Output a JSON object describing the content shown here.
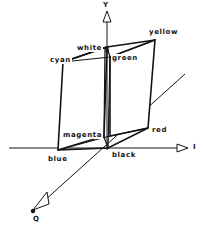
{
  "figure": {
    "background_color": "#ffffff",
    "line_color": "#141414",
    "axes": [
      {
        "name": "Y",
        "label": "Y",
        "orientation": "vertical-up",
        "arrow": "hollow-triangle",
        "label_x": 103,
        "label_y": 2
      },
      {
        "name": "I",
        "label": "I",
        "orientation": "horizontal-right",
        "arrow": "hollow-triangle",
        "label_x": 194,
        "label_y": 143
      },
      {
        "name": "Q",
        "label": "Q",
        "orientation": "diagonal-down-left",
        "arrow": "hollow-triangle",
        "label_x": 33,
        "label_y": 216
      }
    ],
    "vertices": [
      {
        "name": "black",
        "label": "black",
        "label_x": 111,
        "label_y": 151
      },
      {
        "name": "blue",
        "label": "blue",
        "label_x": 47,
        "label_y": 155
      },
      {
        "name": "red",
        "label": "red",
        "label_x": 151,
        "label_y": 126
      },
      {
        "name": "magenta",
        "label": "magenta",
        "label_x": 62,
        "label_y": 131
      },
      {
        "name": "green",
        "label": "green",
        "label_x": 111,
        "label_y": 54
      },
      {
        "name": "cyan",
        "label": "cyan",
        "label_x": 49,
        "label_y": 56
      },
      {
        "name": "yellow",
        "label": "yellow",
        "label_x": 148,
        "label_y": 28
      },
      {
        "name": "white",
        "label": "white",
        "label_x": 76,
        "label_y": 44
      }
    ]
  }
}
